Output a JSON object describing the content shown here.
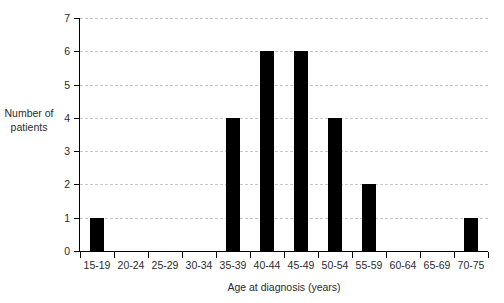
{
  "chart_data": {
    "type": "bar",
    "title": "",
    "subtitle": "",
    "xlabel": "Age at diagnosis (years)",
    "ylabel": "Number of\npatients",
    "ylabel_lines": [
      "Number of",
      "patients"
    ],
    "categories": [
      "15-19",
      "20-24",
      "25-29",
      "30-34",
      "35-39",
      "40-44",
      "45-49",
      "50-54",
      "55-59",
      "60-64",
      "65-69",
      "70-75"
    ],
    "values": [
      1,
      0,
      0,
      0,
      4,
      6,
      6,
      4,
      2,
      0,
      0,
      1
    ],
    "ylim": [
      0,
      7
    ],
    "ytick_values": [
      0,
      1,
      2,
      3,
      4,
      5,
      6,
      7
    ],
    "ytick_labels": [
      "0",
      "1",
      "2",
      "3",
      "4",
      "5",
      "6",
      "7"
    ],
    "grid": true,
    "grid_axis": "y",
    "grid_style": "dashed",
    "legend": false,
    "legend_position": "none",
    "bar_color": "#000000",
    "grid_color": "#c8c8c8",
    "axis_color": "#000000",
    "text_color": "#2b2b2b",
    "background": "#ffffff",
    "total": 24
  }
}
